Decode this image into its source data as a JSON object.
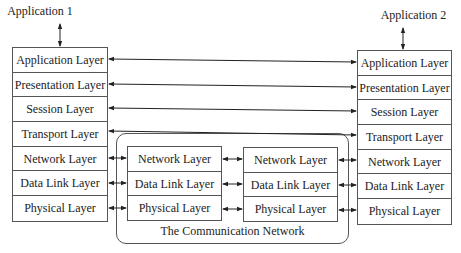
{
  "app1": {
    "label": "Application 1"
  },
  "app2": {
    "label": "Application 2"
  },
  "left_stack": {
    "layers": [
      "Application Layer",
      "Presentation Layer",
      "Session Layer",
      "Transport Layer",
      "Network Layer",
      "Data Link Layer",
      "Physical Layer"
    ]
  },
  "right_stack": {
    "layers": [
      "Application Layer",
      "Presentation Layer",
      "Session Layer",
      "Transport Layer",
      "Network Layer",
      "Data Link Layer",
      "Physical Layer"
    ]
  },
  "network": {
    "label": "The Communication Network",
    "node1": {
      "layers": [
        "Network Layer",
        "Data Link Layer",
        "Physical Layer"
      ]
    },
    "node2": {
      "layers": [
        "Network Layer",
        "Data Link Layer",
        "Physical Layer"
      ]
    }
  }
}
